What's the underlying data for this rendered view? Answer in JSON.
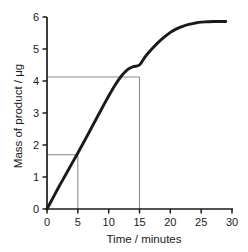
{
  "chart_data": {
    "type": "line",
    "title": "",
    "xlabel": "Time / minutes",
    "ylabel": "Mass of product / μg",
    "xlim": [
      0,
      30
    ],
    "ylim": [
      0,
      6
    ],
    "xticks": [
      "0",
      "5",
      "10",
      "15",
      "20",
      "25",
      "30"
    ],
    "xtick_values": [
      0,
      5,
      10,
      15,
      20,
      25,
      30
    ],
    "yticks": [
      "0",
      "1",
      "2",
      "3",
      "4",
      "5",
      "6"
    ],
    "ytick_values": [
      0,
      1,
      2,
      3,
      4,
      5,
      6
    ],
    "grid": false,
    "legend": null,
    "series": [
      {
        "name": "Mass of product",
        "color": "#1a1a1a",
        "x": [
          0,
          1,
          2,
          3,
          4,
          5,
          6,
          7,
          8,
          9,
          10,
          11,
          12,
          13,
          14,
          15,
          16,
          17,
          18,
          19,
          20,
          21,
          22,
          23,
          24,
          25,
          26,
          27,
          28,
          29
        ],
        "y": [
          0.0,
          0.36,
          0.72,
          1.06,
          1.41,
          1.75,
          2.1,
          2.46,
          2.82,
          3.18,
          3.53,
          3.86,
          4.14,
          4.35,
          4.45,
          4.5,
          4.78,
          5.0,
          5.2,
          5.37,
          5.52,
          5.63,
          5.71,
          5.77,
          5.81,
          5.84,
          5.85,
          5.86,
          5.86,
          5.86
        ]
      }
    ],
    "annotations": [
      {
        "name": "construction-lines-lower",
        "color": "#8c8c8c",
        "x": 5,
        "y": 1.75,
        "label": "1.75"
      },
      {
        "name": "construction-lines-upper",
        "color": "#8c8c8c",
        "x": 15,
        "y": 4.5,
        "label": "4.5"
      }
    ]
  },
  "axes": {
    "x_title": "Time / minutes",
    "y_title": "Mass of product / μg",
    "x_tick_0": "0",
    "x_tick_1": "5",
    "x_tick_2": "10",
    "x_tick_3": "15",
    "x_tick_4": "20",
    "x_tick_5": "25",
    "x_tick_6": "30",
    "y_tick_0": "0",
    "y_tick_1": "1",
    "y_tick_2": "2",
    "y_tick_3": "3",
    "y_tick_4": "4",
    "y_tick_5": "5",
    "y_tick_6": "6"
  },
  "colors": {
    "curve": "#1a1a1a",
    "axis": "#1a1a1a",
    "guide": "#8c8c8c",
    "background": "#ffffff",
    "text": "#1a1a1a"
  }
}
